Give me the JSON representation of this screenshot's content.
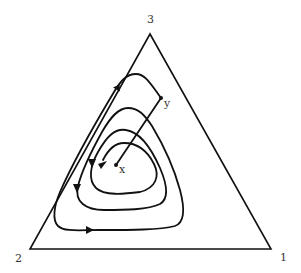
{
  "diagram": {
    "type": "simplex-phase-portrait",
    "vertices": [
      {
        "label": "1",
        "position": "bottom-right"
      },
      {
        "label": "2",
        "position": "bottom-left"
      },
      {
        "label": "3",
        "position": "top"
      }
    ],
    "points": [
      {
        "label": "x",
        "role": "interior fixed point"
      },
      {
        "label": "y",
        "role": "starting point of orbit"
      }
    ],
    "orbit": {
      "description": "spiral trajectory from y winding outward toward boundary, with straight segment from y to x",
      "arrow_count": 5
    },
    "colors": {
      "stroke": "#111111",
      "label": "#333333",
      "background": "#ffffff"
    }
  }
}
